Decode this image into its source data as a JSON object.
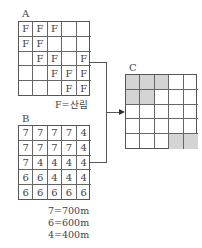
{
  "grid_a": {
    "label": "A",
    "cells": [
      [
        "F",
        "F",
        "F",
        "",
        ""
      ],
      [
        "F",
        "F",
        "",
        "",
        ""
      ],
      [
        "",
        "F",
        "F",
        "",
        "F"
      ],
      [
        "",
        "",
        "F",
        "F",
        "F"
      ],
      [
        "",
        "",
        "",
        "F",
        "F"
      ]
    ],
    "legend": "F=산림"
  },
  "grid_b": {
    "label": "B",
    "cells": [
      [
        "7",
        "7",
        "7",
        "7",
        "4"
      ],
      [
        "7",
        "7",
        "7",
        "7",
        "4"
      ],
      [
        "7",
        "4",
        "4",
        "4",
        "4"
      ],
      [
        "6",
        "6",
        "4",
        "4",
        "4"
      ],
      [
        "6",
        "6",
        "6",
        "6",
        "6"
      ]
    ],
    "legend": [
      "7=700m",
      "6=600m",
      "4=400m"
    ]
  },
  "grid_c": {
    "label": "C",
    "shaded": [
      [
        true,
        true,
        true,
        false,
        false
      ],
      [
        true,
        true,
        false,
        false,
        false
      ],
      [
        false,
        false,
        false,
        false,
        false
      ],
      [
        false,
        false,
        false,
        false,
        false
      ],
      [
        false,
        false,
        false,
        true,
        true
      ]
    ],
    "shade_color": "#d4d4d4"
  }
}
